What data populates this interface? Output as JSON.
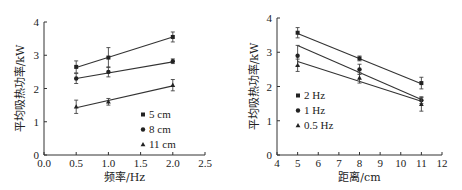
{
  "chart_data": [
    {
      "type": "line",
      "title": "",
      "xlabel": "频率/Hz",
      "ylabel": "平均吸热功率/kW",
      "xlim": [
        0.0,
        2.5
      ],
      "ylim": [
        0,
        4
      ],
      "xticks": [
        "0.0",
        "0.5",
        "1.0",
        "1.5",
        "2.0",
        "2.5"
      ],
      "yticks": [
        "0",
        "1",
        "2",
        "3",
        "4"
      ],
      "grid": false,
      "legend_position": "lower right",
      "x": [
        0.5,
        1.0,
        2.0
      ],
      "series": [
        {
          "name": "5 cm",
          "marker": "square",
          "values": [
            2.65,
            2.93,
            3.55
          ],
          "errors": [
            0.18,
            0.3,
            0.15
          ],
          "fit": [
            2.63,
            3.55
          ]
        },
        {
          "name": "8 cm",
          "marker": "circle",
          "values": [
            2.3,
            2.5,
            2.82
          ],
          "errors": [
            0.15,
            0.15,
            0.07
          ],
          "fit": [
            2.3,
            2.8
          ]
        },
        {
          "name": "11 cm",
          "marker": "triangle",
          "values": [
            1.45,
            1.6,
            2.1
          ],
          "errors": [
            0.2,
            0.1,
            0.17
          ],
          "fit": [
            1.42,
            2.08
          ]
        }
      ]
    },
    {
      "type": "line",
      "title": "",
      "xlabel": "距离/cm",
      "ylabel": "平均吸热功率/kW",
      "xlim": [
        4,
        12
      ],
      "ylim": [
        0,
        4
      ],
      "xticks": [
        "4",
        "5",
        "6",
        "7",
        "8",
        "9",
        "10",
        "11",
        "12"
      ],
      "yticks": [
        "0",
        "1",
        "2",
        "3",
        "4"
      ],
      "grid": false,
      "legend_position": "lower left",
      "x": [
        5,
        8,
        11
      ],
      "series": [
        {
          "name": "2 Hz",
          "marker": "square",
          "values": [
            3.57,
            2.82,
            2.1
          ],
          "errors": [
            0.15,
            0.07,
            0.17
          ],
          "fit": [
            3.55,
            2.08
          ]
        },
        {
          "name": "1 Hz",
          "marker": "circle",
          "values": [
            2.9,
            2.5,
            1.6
          ],
          "errors": [
            0.3,
            0.15,
            0.1
          ],
          "fit": [
            3.2,
            1.62
          ]
        },
        {
          "name": "0.5 Hz",
          "marker": "triangle",
          "values": [
            2.62,
            2.25,
            1.48
          ],
          "errors": [
            0.18,
            0.15,
            0.2
          ],
          "fit": [
            2.73,
            1.57
          ]
        }
      ]
    }
  ]
}
